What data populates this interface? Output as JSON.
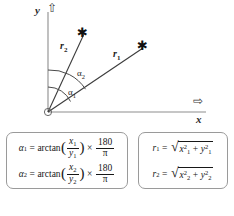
{
  "diagram": {
    "axes": {
      "y_label": "y",
      "x_label": "x",
      "y_arrow_glyph": "⇧",
      "x_arrow_glyph": "⇨"
    },
    "origin_marker": "circle",
    "rays": [
      {
        "id": "r2",
        "label": "r",
        "subscript": "2",
        "endpoint_marker": "✱"
      },
      {
        "id": "r1",
        "label": "r",
        "subscript": "1",
        "endpoint_marker": "✱"
      }
    ],
    "angles": [
      {
        "id": "alpha2",
        "symbol": "α",
        "subscript": "2"
      },
      {
        "id": "alpha1",
        "symbol": "α",
        "subscript": "1"
      }
    ]
  },
  "formulas": {
    "angle_box": [
      {
        "lhs_symbol": "α",
        "lhs_subscript": "1",
        "equals": "=",
        "function": "arctan",
        "open_paren": "(",
        "numerator_var": "x",
        "numerator_sub": "1",
        "denominator_var": "y",
        "denominator_sub": "1",
        "close_paren": ")",
        "times": "×",
        "factor_numerator": "180",
        "factor_denominator": "π"
      },
      {
        "lhs_symbol": "α",
        "lhs_subscript": "2",
        "equals": "=",
        "function": "arctan",
        "open_paren": "(",
        "numerator_var": "x",
        "numerator_sub": "2",
        "denominator_var": "y",
        "denominator_sub": "2",
        "close_paren": ")",
        "times": "×",
        "factor_numerator": "180",
        "factor_denominator": "π"
      }
    ],
    "radius_box": [
      {
        "lhs_symbol": "r",
        "lhs_subscript": "1",
        "equals": "=",
        "radical": "√",
        "term1_var": "x",
        "term1_sub": "1",
        "term1_sup": "2",
        "plus": "+",
        "term2_var": "y",
        "term2_sub": "1",
        "term2_sup": "2"
      },
      {
        "lhs_symbol": "r",
        "lhs_subscript": "2",
        "equals": "=",
        "radical": "√",
        "term1_var": "x",
        "term1_sub": "2",
        "term1_sup": "2",
        "plus": "+",
        "term2_var": "y",
        "term2_sub": "2",
        "term2_sup": "2"
      }
    ]
  },
  "colors": {
    "background": "#ffffff",
    "ink": "#171717",
    "axis": "#8d8d8d",
    "ray": "#3c3c3c",
    "box_border": "#9a9a9a"
  }
}
